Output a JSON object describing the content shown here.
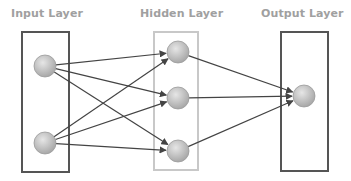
{
  "diagram": {
    "type": "neural-network",
    "layers": [
      {
        "id": "input",
        "label": "Input Layer",
        "box": {
          "x": 22,
          "y": 32,
          "w": 47,
          "h": 140,
          "stroke": "#555555",
          "stroke_width": 2
        },
        "nodes": [
          {
            "id": "i1",
            "cx": 45,
            "cy": 66
          },
          {
            "id": "i2",
            "cx": 45,
            "cy": 143
          }
        ]
      },
      {
        "id": "hidden",
        "label": "Hidden Layer",
        "box": {
          "x": 154,
          "y": 32,
          "w": 44,
          "h": 138,
          "stroke": "#c8c8c8",
          "stroke_width": 2
        },
        "nodes": [
          {
            "id": "h1",
            "cx": 178,
            "cy": 52
          },
          {
            "id": "h2",
            "cx": 178,
            "cy": 98
          },
          {
            "id": "h3",
            "cx": 178,
            "cy": 151
          }
        ]
      },
      {
        "id": "output",
        "label": "Output Layer",
        "box": {
          "x": 281,
          "y": 32,
          "w": 47,
          "h": 139,
          "stroke": "#555555",
          "stroke_width": 2
        },
        "nodes": [
          {
            "id": "o1",
            "cx": 304,
            "cy": 96
          }
        ]
      }
    ],
    "edges": [
      {
        "from": "i1",
        "to": "h1"
      },
      {
        "from": "i1",
        "to": "h2"
      },
      {
        "from": "i1",
        "to": "h3"
      },
      {
        "from": "i2",
        "to": "h1"
      },
      {
        "from": "i2",
        "to": "h2"
      },
      {
        "from": "i2",
        "to": "h3"
      },
      {
        "from": "h1",
        "to": "o1"
      },
      {
        "from": "h2",
        "to": "o1"
      },
      {
        "from": "h3",
        "to": "o1"
      }
    ],
    "node_radius": 11,
    "colors": {
      "label": "#a0a0a0",
      "edge": "#444444",
      "node_light": "#e6e6e6",
      "node_dark": "#a8a8a8",
      "node_stroke": "#9a9a9a"
    }
  }
}
